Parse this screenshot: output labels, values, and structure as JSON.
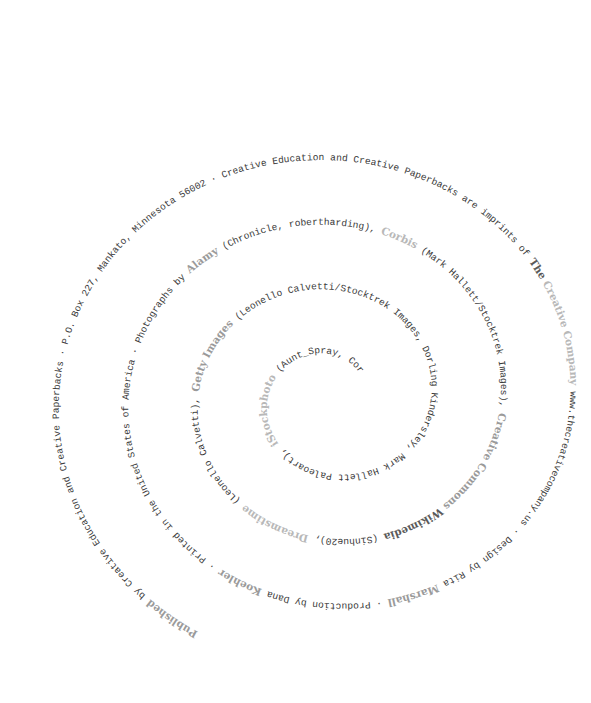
{
  "page": {
    "type": "copyright-page",
    "layout": "spiral-text"
  },
  "colors": {
    "text": "#3a3a3a",
    "brand_light": "#b8b8b8",
    "brand_mid": "#9a9a9a",
    "brand_dark": "#5a5a5a",
    "background": "#ffffff"
  },
  "segments": [
    {
      "text": "Published",
      "style": "brand",
      "tone": "mid"
    },
    {
      "text": " by Creative Education and Creative Paperbacks · P.O. Box 227, Mankato, Minnesota 56002 · Creative Education and Creative Paperbacks are imprints of ",
      "style": "mono"
    },
    {
      "text": "The",
      "style": "brand",
      "tone": "dark"
    },
    {
      "text": " Creative Company",
      "style": "brand",
      "tone": "light"
    },
    {
      "text": " www.thecreativecompany.us · Design by Rita ",
      "style": "mono"
    },
    {
      "text": "Marshall",
      "style": "brand",
      "tone": "mid"
    },
    {
      "text": " · Production by Dana ",
      "style": "mono"
    },
    {
      "text": "Koehler",
      "style": "brand",
      "tone": "mid"
    },
    {
      "text": " · Printed in the United States of America · Photographs by ",
      "style": "mono"
    },
    {
      "text": "Alamy",
      "style": "brand",
      "tone": "mid"
    },
    {
      "text": " (Chronicle, robertharding), ",
      "style": "mono"
    },
    {
      "text": "Corbis",
      "style": "brand",
      "tone": "light"
    },
    {
      "text": " (Mark Hallett/Stocktrek Images), ",
      "style": "mono"
    },
    {
      "text": "Creative Commons",
      "style": "brand",
      "tone": "mid"
    },
    {
      "text": " Wikimedia",
      "style": "brand",
      "tone": "dark"
    },
    {
      "text": " (Sinhue20), ",
      "style": "mono"
    },
    {
      "text": "Dreamstime",
      "style": "brand",
      "tone": "light"
    },
    {
      "text": " (Leonello Calvetti), ",
      "style": "mono"
    },
    {
      "text": "Getty Images",
      "style": "brand",
      "tone": "mid"
    },
    {
      "text": " (Leonello Calvetti/Stocktrek Images, Dorling Kindersley, Mark Hallett Paleoart), ",
      "style": "mono"
    },
    {
      "text": "iStockphoto",
      "style": "brand",
      "tone": "light"
    },
    {
      "text": " (Aunt_Spray, CoreyFord, Daniel Eskridge, JordiRamisa, leonello, Orla, Vac1), ",
      "style": "mono"
    },
    {
      "text": "Science",
      "style": "brand",
      "tone": "dark"
    },
    {
      "text": " Photo Library",
      "style": "brand",
      "tone": "light"
    },
    {
      "text": " (SPUTNIK), ",
      "style": "mono"
    },
    {
      "text": "Shutterstock",
      "style": "brand",
      "tone": "light"
    },
    {
      "text": " (AuntSpray, Graphic_Design, nuclear_lily, Orja, StockSmartStart)",
      "style": "mono"
    }
  ],
  "spiral": {
    "center_x": 332,
    "center_y": 398,
    "outer_radius": 285,
    "inner_radius": 38,
    "start_angle_deg": 118,
    "turns": 3.55,
    "y_scale": 0.93
  }
}
